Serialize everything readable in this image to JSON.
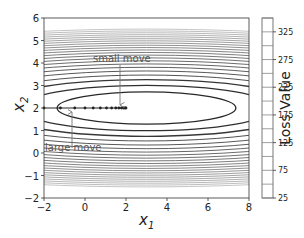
{
  "chart_data": {
    "type": "contour",
    "title": "",
    "xlabel": "x1",
    "ylabel": "x2",
    "xlim": [
      -2,
      8
    ],
    "ylim": [
      -2,
      6
    ],
    "xticks": [
      "−2",
      "0",
      "2",
      "4",
      "6",
      "8"
    ],
    "xtick_values": [
      -2,
      0,
      2,
      4,
      6,
      8
    ],
    "yticks": [
      "−2",
      "−1",
      "0",
      "1",
      "2",
      "3",
      "4",
      "5",
      "6"
    ],
    "ytick_values": [
      -2,
      -1,
      0,
      1,
      2,
      3,
      4,
      5,
      6
    ],
    "contour_center": [
      3,
      2
    ],
    "colorbar": {
      "label": "Loss Value",
      "ticks": [
        "25",
        "75",
        "125",
        "175",
        "225",
        "275",
        "325"
      ],
      "tick_values": [
        25,
        75,
        125,
        175,
        225,
        275,
        325
      ],
      "range": [
        25,
        350
      ]
    },
    "trajectory": {
      "y": 2,
      "x": [
        -2,
        -1.2,
        -0.5,
        0.0,
        0.4,
        0.75,
        1.05,
        1.3,
        1.5,
        1.65,
        1.78,
        1.88,
        1.95,
        2.0
      ]
    },
    "annotations": [
      {
        "text": "small move",
        "text_pos": [
          1.8,
          4.05
        ],
        "arrow_to": [
          1.95,
          2.05
        ]
      },
      {
        "text": "large move",
        "text_pos": [
          -0.6,
          0.35
        ],
        "arrow_to": [
          -0.6,
          1.9
        ]
      }
    ],
    "grid": false,
    "legend": null
  },
  "labels": {
    "x1_base": "x",
    "x1_sub": "1",
    "x2_base": "x",
    "x2_sub": "2",
    "colorbar_label": "Loss Value",
    "small_move": "small move",
    "large_move": "large move"
  }
}
